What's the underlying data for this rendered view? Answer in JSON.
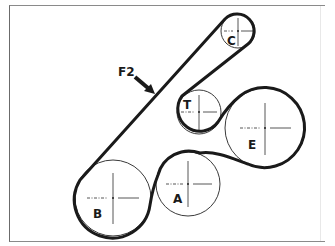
{
  "figure": {
    "type": "belt-routing-diagram",
    "callout": {
      "label": "F2"
    },
    "pulleys": [
      {
        "id": "C",
        "label": "C",
        "cx": 238,
        "cy": 31,
        "r": 17
      },
      {
        "id": "T",
        "label": "T",
        "cx": 199,
        "cy": 112,
        "r": 22
      },
      {
        "id": "E",
        "label": "E",
        "cx": 265,
        "cy": 128,
        "r": 40
      },
      {
        "id": "A",
        "label": "A",
        "cx": 188,
        "cy": 184,
        "r": 32
      },
      {
        "id": "B",
        "label": "B",
        "cx": 113,
        "cy": 198,
        "r": 38
      }
    ],
    "colors": {
      "belt": "#1a1a1a",
      "pulley_outline": "#3a3a3a",
      "frame": "#7a7a7a"
    }
  }
}
